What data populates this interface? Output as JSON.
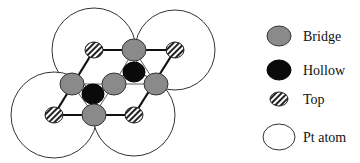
{
  "diagram": {
    "colors": {
      "bridge": "#8a8a8a",
      "hollow": "#0a0a0a",
      "top_stripe": "#222222",
      "top_bg": "#ffffff",
      "pt_atom": "#ffffff",
      "stroke": "#111111"
    },
    "pt_atoms": [
      {
        "cx": 94,
        "cy": 50,
        "r": 42
      },
      {
        "cx": 175,
        "cy": 50,
        "r": 40
      },
      {
        "cx": 54,
        "cy": 115,
        "r": 43
      },
      {
        "cx": 134,
        "cy": 115,
        "r": 41
      }
    ],
    "top_sites": [
      {
        "cx": 94,
        "cy": 50
      },
      {
        "cx": 175,
        "cy": 50
      },
      {
        "cx": 54,
        "cy": 115
      },
      {
        "cx": 134,
        "cy": 115
      }
    ],
    "bridge_sites": [
      {
        "cx": 134,
        "cy": 50
      },
      {
        "cx": 72,
        "cy": 84
      },
      {
        "cx": 114,
        "cy": 84
      },
      {
        "cx": 156,
        "cy": 84
      },
      {
        "cx": 94,
        "cy": 115
      }
    ],
    "hollow_sites": [
      {
        "cx": 134,
        "cy": 72
      },
      {
        "cx": 93,
        "cy": 94
      }
    ]
  },
  "legend": {
    "items": [
      {
        "type": "bridge",
        "label": "Bridge"
      },
      {
        "type": "hollow",
        "label": "Hollow"
      },
      {
        "type": "top",
        "label": "Top"
      },
      {
        "type": "pt_atom",
        "label": "Pt atom"
      }
    ]
  }
}
